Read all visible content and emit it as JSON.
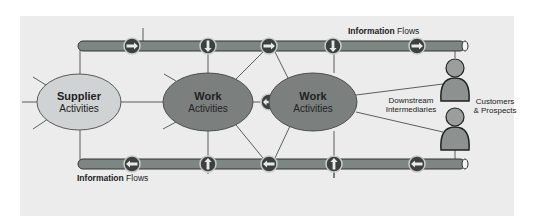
{
  "colors": {
    "panel": "#ececec",
    "pipe_fill": "#7e8684",
    "pipe_stroke": "#2f3433",
    "supplier_fill": "#cfd3d3",
    "work_fill": "#7b807f",
    "connector_fill": "#3c4140",
    "connector_ring": "#c9cccc",
    "person_fill": "#8d9291",
    "line": "#4a4f4e"
  },
  "labels": {
    "top_flow": {
      "bold": "Information",
      "normal": " Flows"
    },
    "bottom_flow": {
      "bold": "Information",
      "normal": " Flows"
    },
    "supplier": {
      "line1": "Supplier",
      "line2": "Activities"
    },
    "work1": {
      "line1": "Work",
      "line2": "Activities"
    },
    "work2": {
      "line1": "Work",
      "line2": "Activities"
    },
    "downstream": {
      "line1": "Downstream",
      "line2": "Intermediaries"
    },
    "customers": {
      "line1": "Customers",
      "line2": "& Prospects"
    }
  },
  "top_connectors": [
    {
      "x": 132,
      "dir": "right"
    },
    {
      "x": 208,
      "dir": "down"
    },
    {
      "x": 269,
      "dir": "right"
    },
    {
      "x": 330,
      "dir": "down"
    },
    {
      "x": 417,
      "dir": "right"
    }
  ],
  "bottom_connectors": [
    {
      "x": 132,
      "dir": "left"
    },
    {
      "x": 208,
      "dir": "up"
    },
    {
      "x": 269,
      "dir": "left"
    },
    {
      "x": 334,
      "dir": "up"
    },
    {
      "x": 417,
      "dir": "left"
    }
  ],
  "middle_connector": {
    "x": 269,
    "dir": "both"
  }
}
